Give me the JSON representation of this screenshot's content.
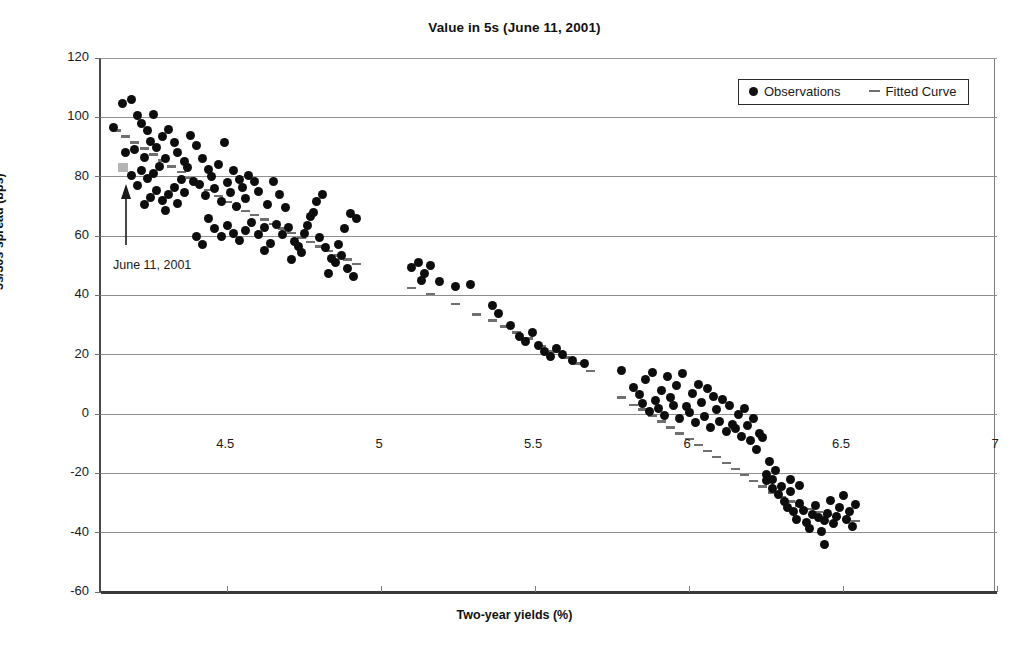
{
  "chart_data": {
    "type": "scatter",
    "title": "Value in 5s (June 11, 2001)",
    "xlabel": "Two-year yields (%)",
    "ylabel": "5s/30s spread (bps)",
    "xlim": [
      4.09,
      7.0
    ],
    "ylim": [
      -60,
      120
    ],
    "xticks": [
      "4.5",
      "5",
      "5.5",
      "6",
      "6.5",
      "7"
    ],
    "xtick_values": [
      4.5,
      5,
      5.5,
      6,
      6.5,
      7
    ],
    "yticks": [
      "120",
      "100",
      "80",
      "60",
      "40",
      "20",
      "0",
      "-20",
      "-40",
      "-60"
    ],
    "ytick_values": [
      120,
      100,
      80,
      60,
      40,
      20,
      0,
      -20,
      -40,
      -60
    ],
    "grid": "horizontal",
    "legend_position": "top-right",
    "legend": [
      {
        "label": "Observations",
        "marker": "dot",
        "color": "#0d0d0d"
      },
      {
        "label": "Fitted Curve",
        "marker": "dash",
        "color": "#707070"
      }
    ],
    "annotation": {
      "text": "June 11, 2001",
      "marker": "square",
      "marker_color": "#b4b4b4",
      "point_x": 4.16,
      "point_y": 83
    },
    "series": [
      {
        "name": "Observations",
        "marker": "dot",
        "color": "#0d0d0d",
        "points": [
          [
            4.16,
            104.5
          ],
          [
            4.19,
            106.0
          ],
          [
            4.13,
            96.5
          ],
          [
            4.21,
            100.5
          ],
          [
            4.22,
            98.0
          ],
          [
            4.24,
            95.5
          ],
          [
            4.25,
            92.0
          ],
          [
            4.26,
            101.0
          ],
          [
            4.2,
            89.0
          ],
          [
            4.17,
            88.0
          ],
          [
            4.23,
            86.5
          ],
          [
            4.27,
            90.0
          ],
          [
            4.29,
            93.5
          ],
          [
            4.31,
            96.0
          ],
          [
            4.33,
            91.5
          ],
          [
            4.3,
            86.0
          ],
          [
            4.28,
            83.5
          ],
          [
            4.26,
            81.0
          ],
          [
            4.24,
            79.5
          ],
          [
            4.22,
            82.0
          ],
          [
            4.21,
            77.0
          ],
          [
            4.19,
            80.5
          ],
          [
            4.34,
            88.0
          ],
          [
            4.36,
            85.0
          ],
          [
            4.38,
            94.0
          ],
          [
            4.4,
            90.5
          ],
          [
            4.37,
            83.0
          ],
          [
            4.35,
            79.0
          ],
          [
            4.33,
            76.5
          ],
          [
            4.31,
            74.0
          ],
          [
            4.29,
            72.0
          ],
          [
            4.27,
            75.5
          ],
          [
            4.25,
            73.0
          ],
          [
            4.23,
            70.5
          ],
          [
            4.3,
            68.5
          ],
          [
            4.34,
            71.0
          ],
          [
            4.36,
            74.5
          ],
          [
            4.39,
            78.5
          ],
          [
            4.42,
            86.0
          ],
          [
            4.44,
            82.5
          ],
          [
            4.41,
            77.5
          ],
          [
            4.43,
            73.5
          ],
          [
            4.45,
            80.0
          ],
          [
            4.47,
            84.0
          ],
          [
            4.49,
            91.5
          ],
          [
            4.46,
            76.0
          ],
          [
            4.48,
            71.5
          ],
          [
            4.5,
            78.0
          ],
          [
            4.52,
            82.0
          ],
          [
            4.54,
            79.0
          ],
          [
            4.51,
            74.5
          ],
          [
            4.53,
            70.0
          ],
          [
            4.55,
            76.5
          ],
          [
            4.57,
            80.5
          ],
          [
            4.59,
            78.5
          ],
          [
            4.44,
            66.0
          ],
          [
            4.46,
            62.5
          ],
          [
            4.48,
            60.0
          ],
          [
            4.5,
            63.5
          ],
          [
            4.52,
            61.0
          ],
          [
            4.54,
            58.5
          ],
          [
            4.56,
            62.0
          ],
          [
            4.58,
            64.5
          ],
          [
            4.6,
            60.5
          ],
          [
            4.62,
            63.0
          ],
          [
            4.4,
            60.0
          ],
          [
            4.42,
            57.0
          ],
          [
            4.56,
            72.5
          ],
          [
            4.6,
            75.0
          ],
          [
            4.63,
            70.5
          ],
          [
            4.65,
            78.5
          ],
          [
            4.67,
            74.0
          ],
          [
            4.69,
            69.5
          ],
          [
            4.66,
            64.0
          ],
          [
            4.68,
            60.5
          ],
          [
            4.7,
            63.0
          ],
          [
            4.72,
            58.0
          ],
          [
            4.74,
            54.5
          ],
          [
            4.71,
            52.0
          ],
          [
            4.73,
            56.5
          ],
          [
            4.75,
            61.0
          ],
          [
            4.77,
            66.5
          ],
          [
            4.79,
            71.5
          ],
          [
            4.81,
            74.0
          ],
          [
            4.78,
            68.0
          ],
          [
            4.76,
            63.5
          ],
          [
            4.8,
            59.5
          ],
          [
            4.82,
            56.0
          ],
          [
            4.84,
            52.5
          ],
          [
            4.86,
            57.0
          ],
          [
            4.88,
            62.5
          ],
          [
            4.9,
            67.5
          ],
          [
            4.92,
            66.0
          ],
          [
            4.87,
            53.5
          ],
          [
            4.89,
            49.0
          ],
          [
            4.91,
            46.5
          ],
          [
            4.83,
            47.5
          ],
          [
            4.85,
            51.0
          ],
          [
            4.64,
            57.5
          ],
          [
            4.62,
            55.0
          ],
          [
            5.1,
            49.5
          ],
          [
            5.12,
            51.0
          ],
          [
            5.14,
            47.5
          ],
          [
            5.13,
            45.0
          ],
          [
            5.16,
            50.0
          ],
          [
            5.19,
            44.5
          ],
          [
            5.24,
            43.0
          ],
          [
            5.29,
            43.5
          ],
          [
            5.36,
            36.5
          ],
          [
            5.38,
            34.0
          ],
          [
            5.42,
            30.0
          ],
          [
            5.45,
            26.0
          ],
          [
            5.47,
            24.5
          ],
          [
            5.49,
            27.5
          ],
          [
            5.51,
            23.0
          ],
          [
            5.53,
            21.0
          ],
          [
            5.55,
            19.5
          ],
          [
            5.57,
            22.0
          ],
          [
            5.59,
            20.0
          ],
          [
            5.62,
            18.0
          ],
          [
            5.66,
            17.0
          ],
          [
            5.78,
            14.5
          ],
          [
            5.82,
            9.0
          ],
          [
            5.84,
            6.5
          ],
          [
            5.86,
            11.5
          ],
          [
            5.88,
            14.0
          ],
          [
            5.85,
            3.5
          ],
          [
            5.87,
            1.0
          ],
          [
            5.89,
            4.5
          ],
          [
            5.91,
            8.0
          ],
          [
            5.93,
            12.5
          ],
          [
            5.9,
            2.0
          ],
          [
            5.92,
            -0.5
          ],
          [
            5.94,
            5.5
          ],
          [
            5.96,
            9.5
          ],
          [
            5.98,
            13.5
          ],
          [
            5.95,
            3.0
          ],
          [
            5.97,
            -1.5
          ],
          [
            5.99,
            2.5
          ],
          [
            6.01,
            7.0
          ],
          [
            6.03,
            10.0
          ],
          [
            6.0,
            0.5
          ],
          [
            6.02,
            -3.0
          ],
          [
            6.04,
            4.0
          ],
          [
            6.06,
            8.5
          ],
          [
            6.08,
            6.0
          ],
          [
            6.05,
            -1.0
          ],
          [
            6.07,
            -4.5
          ],
          [
            6.09,
            1.5
          ],
          [
            6.11,
            5.0
          ],
          [
            6.13,
            3.0
          ],
          [
            6.1,
            -2.5
          ],
          [
            6.12,
            -6.0
          ],
          [
            6.14,
            -3.5
          ],
          [
            6.16,
            0.0
          ],
          [
            6.18,
            2.0
          ],
          [
            6.15,
            -5.0
          ],
          [
            6.17,
            -7.5
          ],
          [
            6.19,
            -4.0
          ],
          [
            6.21,
            -1.5
          ],
          [
            6.23,
            -6.5
          ],
          [
            6.2,
            -9.0
          ],
          [
            6.22,
            -12.0
          ],
          [
            6.24,
            -8.0
          ],
          [
            6.26,
            -16.0
          ],
          [
            6.25,
            -20.5
          ],
          [
            6.27,
            -22.0
          ],
          [
            6.28,
            -19.0
          ],
          [
            6.3,
            -24.5
          ],
          [
            6.29,
            -27.0
          ],
          [
            6.31,
            -29.5
          ],
          [
            6.33,
            -26.0
          ],
          [
            6.32,
            -31.5
          ],
          [
            6.34,
            -33.0
          ],
          [
            6.36,
            -30.0
          ],
          [
            6.35,
            -35.5
          ],
          [
            6.37,
            -32.5
          ],
          [
            6.38,
            -36.5
          ],
          [
            6.4,
            -34.0
          ],
          [
            6.39,
            -38.5
          ],
          [
            6.41,
            -31.0
          ],
          [
            6.42,
            -35.0
          ],
          [
            6.43,
            -39.5
          ],
          [
            6.44,
            -36.0
          ],
          [
            6.45,
            -33.5
          ],
          [
            6.46,
            -29.0
          ],
          [
            6.47,
            -37.0
          ],
          [
            6.48,
            -34.5
          ],
          [
            6.49,
            -31.5
          ],
          [
            6.5,
            -27.5
          ],
          [
            6.51,
            -35.5
          ],
          [
            6.52,
            -33.0
          ],
          [
            6.53,
            -38.0
          ],
          [
            6.54,
            -30.5
          ],
          [
            6.44,
            -44.0
          ],
          [
            6.25,
            -22.5
          ],
          [
            6.27,
            -25.0
          ],
          [
            6.33,
            -22.0
          ],
          [
            6.36,
            -24.0
          ]
        ]
      },
      {
        "name": "Fitted Curve",
        "marker": "dash",
        "color": "#707070",
        "points": [
          [
            4.14,
            95.5
          ],
          [
            4.17,
            93.5
          ],
          [
            4.2,
            91.5
          ],
          [
            4.23,
            89.5
          ],
          [
            4.26,
            87.5
          ],
          [
            4.29,
            85.5
          ],
          [
            4.32,
            83.5
          ],
          [
            4.35,
            81.5
          ],
          [
            4.38,
            79.5
          ],
          [
            4.41,
            77.5
          ],
          [
            4.44,
            75.5
          ],
          [
            4.47,
            73.5
          ],
          [
            4.5,
            71.5
          ],
          [
            4.53,
            70.0
          ],
          [
            4.56,
            68.5
          ],
          [
            4.59,
            67.0
          ],
          [
            4.62,
            65.5
          ],
          [
            4.65,
            64.0
          ],
          [
            4.68,
            62.5
          ],
          [
            4.71,
            61.0
          ],
          [
            4.74,
            59.5
          ],
          [
            4.77,
            58.0
          ],
          [
            4.8,
            56.5
          ],
          [
            4.83,
            55.0
          ],
          [
            4.86,
            53.5
          ],
          [
            4.89,
            52.0
          ],
          [
            4.92,
            50.5
          ],
          [
            5.1,
            42.5
          ],
          [
            5.16,
            40.5
          ],
          [
            5.24,
            37.0
          ],
          [
            5.31,
            33.5
          ],
          [
            5.36,
            31.5
          ],
          [
            5.4,
            29.5
          ],
          [
            5.44,
            27.5
          ],
          [
            5.48,
            25.5
          ],
          [
            5.52,
            23.0
          ],
          [
            5.56,
            21.0
          ],
          [
            5.6,
            19.0
          ],
          [
            5.64,
            17.0
          ],
          [
            5.68,
            14.5
          ],
          [
            5.78,
            5.5
          ],
          [
            5.82,
            3.0
          ],
          [
            5.85,
            1.5
          ],
          [
            5.88,
            -0.5
          ],
          [
            5.91,
            -2.5
          ],
          [
            5.94,
            -4.5
          ],
          [
            5.97,
            -6.5
          ],
          [
            6.0,
            -8.5
          ],
          [
            6.03,
            -10.5
          ],
          [
            6.06,
            -12.5
          ],
          [
            6.09,
            -14.5
          ],
          [
            6.12,
            -16.5
          ],
          [
            6.15,
            -18.5
          ],
          [
            6.18,
            -20.5
          ],
          [
            6.21,
            -22.5
          ],
          [
            6.24,
            -24.5
          ],
          [
            6.27,
            -26.5
          ],
          [
            6.3,
            -28.0
          ],
          [
            6.33,
            -29.5
          ],
          [
            6.36,
            -31.0
          ],
          [
            6.39,
            -32.0
          ],
          [
            6.42,
            -33.0
          ],
          [
            6.45,
            -34.0
          ],
          [
            6.48,
            -34.8
          ],
          [
            6.51,
            -35.5
          ],
          [
            6.54,
            -36.0
          ]
        ]
      }
    ]
  }
}
